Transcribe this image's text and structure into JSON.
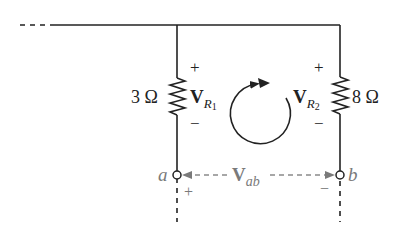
{
  "diagram": {
    "type": "circuit",
    "resistors": [
      {
        "id": "R1",
        "value": "3 Ω",
        "voltage_label": "V",
        "voltage_sub": "R",
        "voltage_subsub": "1",
        "plus": "+",
        "minus": "−"
      },
      {
        "id": "R2",
        "value": "8 Ω",
        "voltage_label": "V",
        "voltage_sub": "R",
        "voltage_subsub": "2",
        "plus": "+",
        "minus": "−"
      }
    ],
    "terminals": [
      {
        "name": "a",
        "polarity": "+"
      },
      {
        "name": "b",
        "polarity": "−"
      }
    ],
    "vab": {
      "label": "V",
      "sub": "ab"
    },
    "loop_direction": "clockwise",
    "colors": {
      "line": "#222222",
      "terminal_annotation": "#7a7a7a",
      "background": "#ffffff"
    }
  }
}
